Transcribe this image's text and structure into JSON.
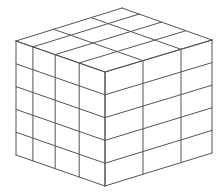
{
  "diagram": {
    "type": "isometric-wireframe-cuboid",
    "line_color": "#555555",
    "background": "#ffffff",
    "vertices": {
      "top_back": [
        122,
        8
      ],
      "top_left": [
        16,
        41
      ],
      "top_front": [
        105,
        72
      ],
      "top_right": [
        212,
        40
      ],
      "bottom_left": [
        16,
        155
      ],
      "bottom_front": [
        105,
        186
      ],
      "bottom_right": [
        212,
        153
      ]
    },
    "left_face": {
      "columns": 4,
      "rows": 5,
      "column_fractions": [
        0,
        0.19,
        0.44,
        0.71,
        1
      ]
    },
    "right_face": {
      "columns": 3,
      "rows": 5,
      "column_fractions": [
        0,
        0.355,
        0.71,
        1
      ]
    },
    "top_face": {
      "divisions_along_left_edge": 4,
      "divisions_along_right_edge": 3
    }
  }
}
